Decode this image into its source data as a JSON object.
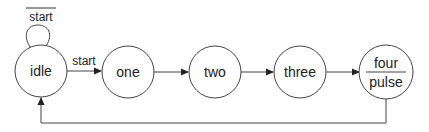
{
  "diagram": {
    "type": "state-machine",
    "states": [
      {
        "id": "idle",
        "label": "idle"
      },
      {
        "id": "one",
        "label": "one"
      },
      {
        "id": "two",
        "label": "two"
      },
      {
        "id": "three",
        "label": "three"
      },
      {
        "id": "four",
        "label": "four",
        "output": "pulse"
      }
    ],
    "transitions": [
      {
        "from": "idle",
        "to": "idle",
        "label": "start",
        "negated": true
      },
      {
        "from": "idle",
        "to": "one",
        "label": "start"
      },
      {
        "from": "one",
        "to": "two",
        "label": ""
      },
      {
        "from": "two",
        "to": "three",
        "label": ""
      },
      {
        "from": "three",
        "to": "four",
        "label": ""
      },
      {
        "from": "four",
        "to": "idle",
        "label": ""
      }
    ],
    "colors": {
      "stroke": "#444444",
      "text": "#222222",
      "background": "#ffffff"
    }
  }
}
